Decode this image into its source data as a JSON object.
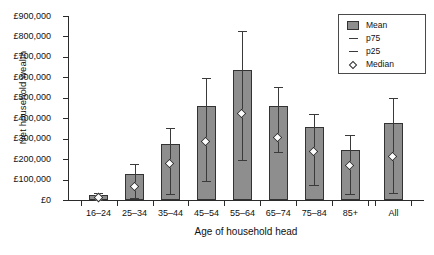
{
  "chart_data": {
    "type": "bar",
    "title": "",
    "xlabel": "Age of household head",
    "ylabel": "Net household wealth",
    "categories": [
      "16–24",
      "25–34",
      "35–44",
      "45–54",
      "55–64",
      "65–74",
      "75–84",
      "85+",
      "All"
    ],
    "ylim": [
      0,
      900000
    ],
    "ytick_values": [
      0,
      100000,
      200000,
      300000,
      400000,
      500000,
      600000,
      700000,
      800000,
      900000
    ],
    "ytick_labels": [
      "£0",
      "£100,000",
      "£200,000",
      "£300,000",
      "£400,000",
      "£500,000",
      "£600,000",
      "£700,000",
      "£800,000",
      "£900,000"
    ],
    "grid": false,
    "legend_position": "top-right",
    "currency_symbol": "£",
    "series": [
      {
        "name": "Mean",
        "type": "bar",
        "values": [
          25000,
          125000,
          275000,
          460000,
          635000,
          460000,
          355000,
          245000,
          375000
        ]
      },
      {
        "name": "p75",
        "type": "whisker-upper",
        "values": [
          35000,
          175000,
          350000,
          595000,
          825000,
          555000,
          420000,
          320000,
          500000
        ]
      },
      {
        "name": "p25",
        "type": "whisker-lower",
        "values": [
          0,
          10000,
          30000,
          95000,
          195000,
          235000,
          75000,
          30000,
          35000
        ]
      },
      {
        "name": "Median",
        "type": "marker",
        "values": [
          10000,
          65000,
          175000,
          285000,
          420000,
          305000,
          235000,
          165000,
          210000
        ]
      }
    ],
    "gap_before_last_category": true,
    "colors": {
      "bar_fill": "#8e8e8e",
      "bar_edge": "#333333",
      "whisker": "#3a3a3a",
      "median_fill": "#fdfdfd",
      "median_edge": "#2f2f2f",
      "axis": "#2b2b2b",
      "text": "#111111",
      "background": "#ffffff"
    }
  },
  "legend": {
    "items": [
      {
        "label": "Mean",
        "key": "bar-swatch"
      },
      {
        "label": "p75",
        "key": "dash"
      },
      {
        "label": "p25",
        "key": "dash"
      },
      {
        "label": "Median",
        "key": "diamond"
      }
    ]
  },
  "caption": {
    "text": ""
  }
}
